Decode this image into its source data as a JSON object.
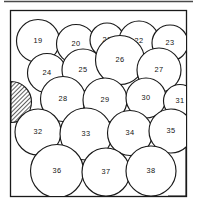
{
  "figure": {
    "colors": {
      "stroke": "#1a1a1a",
      "fill": "#ffffff",
      "hatch": "#2b2b2b",
      "background": "#ffffff",
      "rule": "#4a4a4a"
    },
    "container": {
      "shape": "square",
      "x": 10.5,
      "y": 10.5,
      "width": 176,
      "height": 186
    },
    "top_rule": {
      "x1": 4,
      "y1": 1.5,
      "x2": 193,
      "y2": 1.5
    }
  },
  "chart_data": {
    "type": "diagram",
    "title": "",
    "xlabel": "",
    "ylabel": "",
    "grid": false,
    "legend": "none",
    "circles": [
      {
        "label": "19",
        "cx": 38,
        "cy": 41,
        "r": 21.5
      },
      {
        "label": "20",
        "cx": 76,
        "cy": 44,
        "r": 19.5
      },
      {
        "label": "21",
        "cx": 107,
        "cy": 40,
        "r": 17.0
      },
      {
        "label": "22",
        "cx": 139,
        "cy": 41,
        "r": 20.0
      },
      {
        "label": "23",
        "cx": 170,
        "cy": 43,
        "r": 18.0
      },
      {
        "label": "24",
        "cx": 47,
        "cy": 73,
        "r": 19.5
      },
      {
        "label": "25",
        "cx": 83,
        "cy": 70,
        "r": 21.0
      },
      {
        "label": "26",
        "cx": 120,
        "cy": 60,
        "r": 24.5
      },
      {
        "label": "27",
        "cx": 159,
        "cy": 70,
        "r": 22.0
      },
      {
        "label": "28",
        "cx": 63,
        "cy": 99,
        "r": 22.5
      },
      {
        "label": "29",
        "cx": 105,
        "cy": 100,
        "r": 22.0
      },
      {
        "label": "30",
        "cx": 146,
        "cy": 98,
        "r": 20.0
      },
      {
        "label": "31",
        "cx": 180,
        "cy": 101,
        "r": 16.5
      },
      {
        "label": "32",
        "cx": 38,
        "cy": 132,
        "r": 23.0
      },
      {
        "label": "33",
        "cx": 86,
        "cy": 134,
        "r": 26.0
      },
      {
        "label": "34",
        "cx": 130,
        "cy": 133,
        "r": 22.5
      },
      {
        "label": "35",
        "cx": 171,
        "cy": 131,
        "r": 22.0
      },
      {
        "label": "36",
        "cx": 57,
        "cy": 171,
        "r": 26.5
      },
      {
        "label": "37",
        "cx": 106,
        "cy": 172,
        "r": 24.0
      },
      {
        "label": "38",
        "cx": 151,
        "cy": 171,
        "r": 25.0
      }
    ],
    "shaded_regions": [
      {
        "name": "left-edge-shaded-lune",
        "path": "M 11 82 A 20.5 20.5 0 0 1 11 123 Z",
        "side": "left"
      },
      {
        "name": "bottom-right-shaded-lune",
        "path": "M 176 148 L 186 148 L 186 195 L 172 195 A 27 27 0 0 0 176 148 Z",
        "side": "bottom-right"
      }
    ]
  }
}
